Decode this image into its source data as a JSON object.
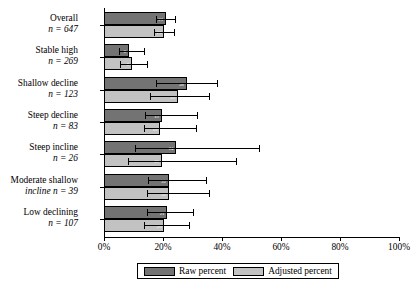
{
  "chart_data": {
    "type": "bar",
    "orientation": "horizontal",
    "title": "",
    "xlabel": "",
    "ylabel": "",
    "xlim": [
      0,
      100
    ],
    "xticks": [
      0,
      20,
      40,
      60,
      80,
      100
    ],
    "xticklabels": [
      "0%",
      "20%",
      "40%",
      "60%",
      "80%",
      "100%"
    ],
    "grid": false,
    "legend_position": "bottom",
    "categories": [
      {
        "label": "Overall",
        "n_prefix": "n = ",
        "n": "647"
      },
      {
        "label": "Stable high",
        "n_prefix": "n = ",
        "n": "269"
      },
      {
        "label": "Shallow decline",
        "n_prefix": "n = ",
        "n": "123"
      },
      {
        "label": "Steep decline",
        "n_prefix": "n = ",
        "n": "83"
      },
      {
        "label": "Steep incline",
        "n_prefix": "n = ",
        "n": "26"
      },
      {
        "label": "Moderate shallow",
        "label2": "incline n = 39",
        "n_prefix": "n = ",
        "n": "39"
      },
      {
        "label": "Low declining",
        "n_prefix": "n = ",
        "n": "107"
      }
    ],
    "series": [
      {
        "name": "Raw percent",
        "color": "#737373",
        "values": [
          21.0,
          8.5,
          28.0,
          19.5,
          24.5,
          22.0,
          21.5
        ],
        "value_labels": [
          "21",
          "8",
          "28",
          "19",
          "24",
          "22",
          "21"
        ],
        "err_low": [
          17.5,
          5.0,
          17.5,
          14.0,
          10.5,
          15.0,
          14.5
        ],
        "err_high": [
          24.5,
          14.0,
          38.5,
          32.0,
          53.0,
          35.0,
          30.5
        ]
      },
      {
        "name": "Adjusted percent",
        "color": "#c2c2c2",
        "values": [
          20.5,
          9.5,
          25.0,
          19.0,
          19.5,
          22.0,
          20.5
        ],
        "value_labels": [
          "20",
          "9",
          "25",
          "19",
          "19",
          "22",
          "20"
        ],
        "err_low": [
          17.0,
          5.5,
          15.5,
          13.5,
          8.0,
          14.5,
          13.5
        ],
        "err_high": [
          24.0,
          15.0,
          36.0,
          31.5,
          45.0,
          36.0,
          29.0
        ]
      }
    ]
  },
  "legend": {
    "items": [
      {
        "label": "Raw percent",
        "color": "#737373"
      },
      {
        "label": "Adjusted percent",
        "color": "#c2c2c2"
      }
    ]
  }
}
